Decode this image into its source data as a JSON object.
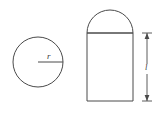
{
  "figure": {
    "background_color": "#ffffff",
    "stroke_color": "#4a4a4a",
    "label_color": "#3a3a3a",
    "circle": {
      "name": "cross-section circle",
      "center_x": 38,
      "center_y": 62,
      "radius": 25,
      "radius_label": "r",
      "radius_label_x": 47,
      "radius_label_y": 59,
      "radius_line_from_x": 38,
      "radius_line_from_y": 62,
      "radius_line_to_x": 63,
      "radius_line_to_y": 62
    },
    "solid": {
      "name": "capped cylinder",
      "body_left": 87,
      "body_right": 133,
      "body_top": 33,
      "body_bottom": 101,
      "cap_radius": 23,
      "cap_apex_y": 10
    },
    "dimension": {
      "name": "length dimension",
      "label": "l",
      "label_x": 145,
      "label_y": 70,
      "line_x": 147,
      "line_top_y": 33,
      "line_bottom_y": 101,
      "tick_half_width": 5,
      "arrow_size": 4
    }
  }
}
